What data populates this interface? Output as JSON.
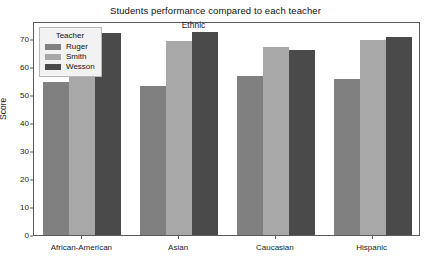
{
  "chart_data": {
    "type": "bar",
    "title": "Students performance compared to each teacher",
    "xlabel": "Ethnic",
    "ylabel": "Score",
    "categories": [
      "African-American",
      "Asian",
      "Caucasian",
      "Hispanic"
    ],
    "series": [
      {
        "name": "Ruger",
        "color": "#808080",
        "values": [
          55.3,
          53.8,
          57.4,
          56.2
        ]
      },
      {
        "name": "Smith",
        "color": "#a8a8a8",
        "values": [
          71.5,
          70.1,
          67.8,
          70.5
        ]
      },
      {
        "name": "Wesson",
        "color": "#4a4a4a",
        "values": [
          72.9,
          73.4,
          66.9,
          71.5
        ]
      }
    ],
    "legend_title": "Teacher",
    "legend_position": "upper left",
    "ylim": [
      0,
      76.5
    ],
    "yticks": [
      0,
      10,
      20,
      30,
      40,
      50,
      60,
      70
    ],
    "ytick_labels": [
      "0",
      "10",
      "20",
      "30",
      "40",
      "50",
      "60",
      "70"
    ],
    "grid": false
  }
}
